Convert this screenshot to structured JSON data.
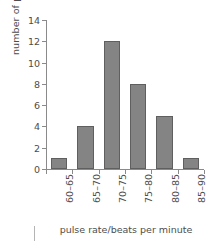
{
  "chart_data": {
    "type": "bar",
    "title": "",
    "subtitle": "",
    "categories": [
      "60–65",
      "65–70",
      "70–75",
      "75–80",
      "80–85",
      "85–90"
    ],
    "values": [
      1,
      4,
      12,
      8,
      5,
      1
    ],
    "series": [
      {
        "name": "number of pupils",
        "values": [
          1,
          4,
          12,
          8,
          5,
          1
        ]
      }
    ],
    "xlabel": "pulse rate/beats per minute",
    "ylabel": "number of pupils",
    "ylim": [
      0,
      14
    ],
    "ytick_labels": [
      "0",
      "2",
      "4",
      "6",
      "8",
      "10",
      "12",
      "14"
    ],
    "ytick_values": [
      0,
      2,
      4,
      6,
      8,
      10,
      12,
      14
    ],
    "ytick_interval": 2,
    "grid": false,
    "legend": false,
    "legend_position": "none",
    "bar_color": "#848484",
    "bar_edge_color": "#5f5f5f",
    "axis_color": "#8a8a8a",
    "text_color": "#4d4d4d",
    "background_color": "#ffffff",
    "xtick_label_rotation": "-90",
    "annotations": []
  }
}
